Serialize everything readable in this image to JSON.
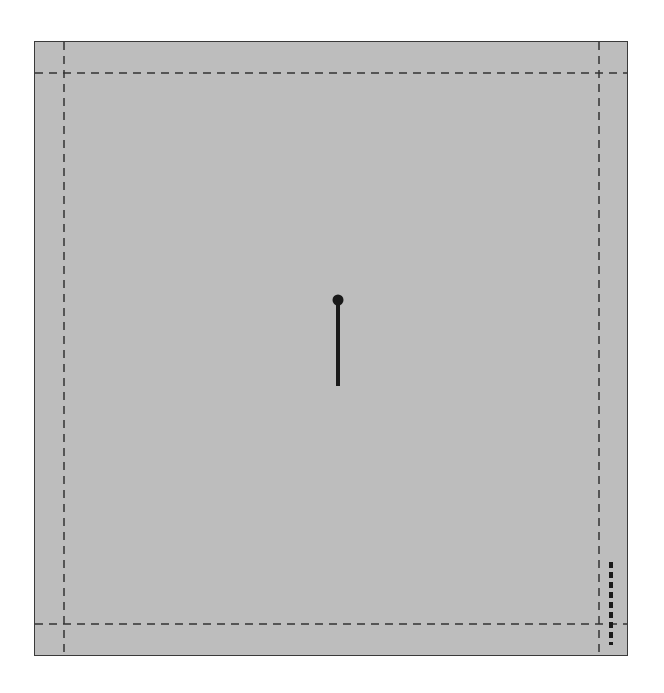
{
  "diagram": {
    "title": "",
    "background_color": "#bdbdbd",
    "border_color": "#3a3a3a",
    "guide_color": "#333333",
    "guides": {
      "vertical_x": [
        64,
        599
      ],
      "horizontal_y": [
        73,
        624
      ]
    },
    "pin": {
      "head": {
        "x": 338,
        "y": 300,
        "r": 5
      },
      "stem": {
        "x": 338,
        "y1": 300,
        "y2": 386
      }
    },
    "marker": {
      "x": 611,
      "y1": 562,
      "y2": 645,
      "label": ""
    }
  }
}
